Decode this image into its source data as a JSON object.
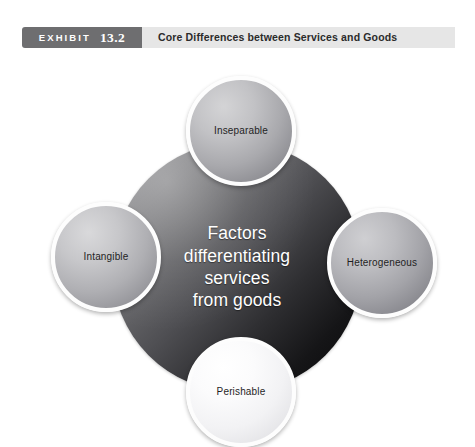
{
  "header": {
    "badge_word": "EXHIBIT",
    "badge_number": "13.2",
    "title": "Core Differences between Services and Goods",
    "badge_color": "#6e6e70",
    "bar_color": "#e6e6e6",
    "badge_text_color": "#ffffff",
    "title_text_color": "#2b2b2b"
  },
  "diagram": {
    "type": "hub-and-spoke",
    "hub": {
      "label_lines": [
        "Factors",
        "differentiating",
        "services",
        "from goods"
      ],
      "text_color": "#ffffff",
      "fill_start_color": "#9a9a9c",
      "fill_end_color": "#070708"
    },
    "nodes": [
      {
        "id": "inseparable",
        "label": "Inseparable",
        "position": "top",
        "fill_color": "#c2c2c5",
        "ring_color": "#fdfdfd",
        "text_color": "#1f1f1f"
      },
      {
        "id": "intangible",
        "label": "Intangible",
        "position": "left",
        "fill_color": "#c7c7ca",
        "ring_color": "#fdfdfd",
        "text_color": "#1f1f1f"
      },
      {
        "id": "heterogeneous",
        "label": "Heterogeneous",
        "position": "right",
        "fill_color": "#bcbcc0",
        "ring_color": "#fdfdfd",
        "text_color": "#1f1f1f"
      },
      {
        "id": "perishable",
        "label": "Perishable",
        "position": "bottom",
        "fill_color": "#fbfbfc",
        "ring_color": "#fdfdfd",
        "text_color": "#1f1f1f"
      }
    ]
  }
}
